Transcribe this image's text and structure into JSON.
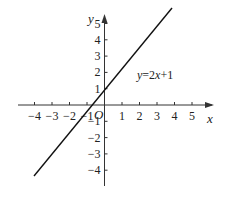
{
  "chart_data": {
    "type": "line",
    "title": "",
    "xlabel": "x",
    "ylabel": "y",
    "origin_label": "O",
    "xlim": [
      -4.5,
      5.7
    ],
    "ylim": [
      -4.6,
      5.8
    ],
    "x_ticks": [
      -4,
      -3,
      -2,
      -1,
      1,
      2,
      3,
      4,
      5
    ],
    "y_ticks": [
      5,
      4,
      3,
      2,
      1,
      -1,
      -2,
      -3,
      -4
    ],
    "x_tick_labels": [
      "−4",
      "−3",
      "−2",
      "−1",
      "1",
      "2",
      "3",
      "4",
      "5"
    ],
    "y_tick_labels": [
      "5",
      "4",
      "3",
      "2",
      "1",
      "−1",
      "−2",
      "−3",
      "−4"
    ],
    "grid": false,
    "series": [
      {
        "name": "y=2x+1",
        "equation": "y=2x+1",
        "slope": 2,
        "intercept": 1,
        "x": [
          -2.5,
          0,
          2.5
        ],
        "y": [
          -4,
          1,
          6
        ]
      }
    ],
    "annotations": [
      {
        "text": "y=2x+1",
        "position": "right of line, near y=2"
      }
    ]
  },
  "labels": {
    "x_axis": "x",
    "y_axis": "y",
    "origin": "O",
    "equation": "y=2x+1"
  }
}
